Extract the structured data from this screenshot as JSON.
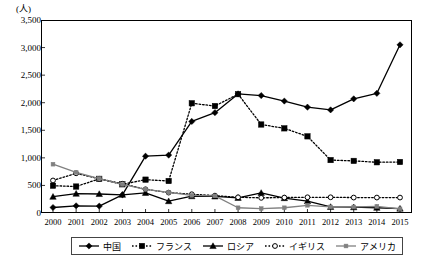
{
  "axis": {
    "unit_label": "(人)",
    "y_ticks": [
      "0",
      "500",
      "1,000",
      "1,500",
      "2,000",
      "2,500",
      "3,000",
      "3,500"
    ]
  },
  "legend": {
    "items": [
      {
        "label": "中国",
        "marker": "diamond",
        "line": "solid",
        "color": "#000000"
      },
      {
        "label": "フランス",
        "marker": "square",
        "line": "dotted",
        "color": "#000000"
      },
      {
        "label": "ロシア",
        "marker": "triangle",
        "line": "solid",
        "color": "#000000"
      },
      {
        "label": "イギリス",
        "marker": "circle-open",
        "line": "dotted",
        "color": "#000000"
      },
      {
        "label": "アメリカ",
        "marker": "square-small",
        "line": "solid",
        "color": "#808080"
      }
    ]
  },
  "chart_data": {
    "type": "line",
    "title": "",
    "xlabel": "",
    "ylabel": "(人)",
    "ylim": [
      0,
      3500
    ],
    "ytick_step": 500,
    "grid": false,
    "legend_position": "bottom",
    "categories": [
      "2000",
      "2001",
      "2002",
      "2003",
      "2004",
      "2005",
      "2006",
      "2007",
      "2008",
      "2009",
      "2010",
      "2011",
      "2012",
      "2013",
      "2014",
      "2015"
    ],
    "series": [
      {
        "name": "中国",
        "marker": "diamond",
        "line": "solid",
        "color": "#000000",
        "values": [
          100,
          130,
          125,
          330,
          1030,
          1050,
          1660,
          1820,
          2160,
          2130,
          2030,
          1920,
          1870,
          2070,
          2170,
          3050
        ]
      },
      {
        "name": "フランス",
        "marker": "square",
        "line": "dotted",
        "color": "#000000",
        "values": [
          495,
          480,
          620,
          520,
          605,
          580,
          1990,
          1940,
          2155,
          1605,
          1535,
          1390,
          960,
          945,
          920,
          925
        ]
      },
      {
        "name": "ロシア",
        "marker": "triangle",
        "line": "solid",
        "color": "#000000",
        "values": [
          295,
          350,
          345,
          330,
          365,
          215,
          305,
          300,
          275,
          365,
          270,
          215,
          110,
          105,
          95,
          80
        ]
      },
      {
        "name": "イギリス",
        "marker": "circle-open",
        "line": "dotted",
        "color": "#000000",
        "values": [
          590,
          720,
          620,
          530,
          430,
          370,
          340,
          315,
          285,
          275,
          280,
          285,
          285,
          280,
          280,
          280
        ]
      },
      {
        "name": "アメリカ",
        "marker": "square-small",
        "line": "solid",
        "color": "#808080",
        "values": [
          885,
          735,
          625,
          520,
          430,
          375,
          320,
          310,
          95,
          80,
          95,
          140,
          110,
          110,
          120,
          75
        ]
      }
    ]
  }
}
